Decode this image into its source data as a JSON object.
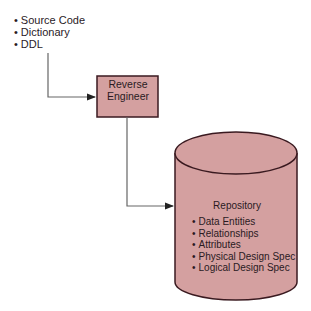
{
  "inputs": {
    "items": [
      "Source Code",
      "Dictionary",
      "DDL"
    ]
  },
  "process": {
    "line1": "Reverse",
    "line2": "Engineer"
  },
  "repository": {
    "title": "Repository",
    "items": [
      "Data Entities",
      "Relationships",
      "Attributes",
      "Physical Design Spec",
      "Logical Design Spec"
    ]
  },
  "colors": {
    "fill": "#d4a0a0",
    "stroke": "#3a1a20",
    "arrow": "#555555"
  }
}
